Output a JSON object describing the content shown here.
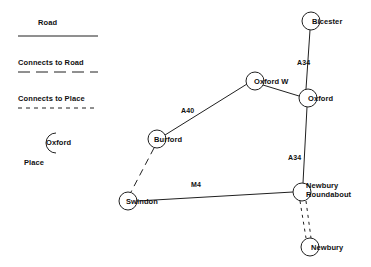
{
  "diagram": {
    "type": "node-link-map",
    "title": "",
    "background_color": "#ffffff",
    "line_color": "#202020",
    "legend": {
      "items": [
        {
          "label": "Road",
          "style": "solid",
          "name": "legend-road"
        },
        {
          "label": "Connects to Road",
          "style": "dashed",
          "name": "legend-connects-to-road"
        },
        {
          "label": "Connects to Place",
          "style": "dotted",
          "name": "legend-connects-to-place"
        }
      ],
      "place_example": {
        "label": "Oxford",
        "caption": "Place"
      }
    },
    "nodes": [
      {
        "id": "bicester",
        "label": "Bicester",
        "cx": 311,
        "cy": 21,
        "r": 9
      },
      {
        "id": "oxford_w",
        "label": "Oxford W",
        "cx": 255,
        "cy": 81,
        "r": 9
      },
      {
        "id": "oxford",
        "label": "Oxford",
        "cx": 308,
        "cy": 98,
        "r": 9
      },
      {
        "id": "burford",
        "label": "Burford",
        "cx": 157,
        "cy": 139,
        "r": 9
      },
      {
        "id": "swindon",
        "label": "Swindon",
        "cx": 128,
        "cy": 201,
        "r": 9
      },
      {
        "id": "newbury_roundabout",
        "label": "Newbury Roundabout",
        "cx": 302,
        "cy": 192,
        "r": 9
      },
      {
        "id": "newbury",
        "label": "Newbury",
        "cx": 310,
        "cy": 247,
        "r": 9
      }
    ],
    "edges": [
      {
        "from": "bicester",
        "to": "oxford",
        "style": "solid",
        "label": "A34"
      },
      {
        "from": "oxford_w",
        "to": "oxford",
        "style": "solid",
        "label": ""
      },
      {
        "from": "burford",
        "to": "oxford_w",
        "style": "solid",
        "label": "A40"
      },
      {
        "from": "oxford",
        "to": "newbury_roundabout",
        "style": "solid",
        "label": "A34"
      },
      {
        "from": "swindon",
        "to": "newbury_roundabout",
        "style": "solid",
        "label": "M4"
      },
      {
        "from": "burford",
        "to": "swindon",
        "style": "dashed",
        "label": ""
      },
      {
        "from": "newbury_roundabout",
        "to": "newbury",
        "style": "dotted",
        "label": ""
      }
    ],
    "edge_labels": [
      {
        "text": "A34",
        "x": 297,
        "y": 59,
        "name": "edge-label-a34-bicester-oxford"
      },
      {
        "text": "A40",
        "x": 181,
        "y": 107,
        "name": "edge-label-a40"
      },
      {
        "text": "A34",
        "x": 288,
        "y": 154,
        "name": "edge-label-a34-oxford-newbury"
      },
      {
        "text": "M4",
        "x": 191,
        "y": 181,
        "name": "edge-label-m4"
      }
    ]
  }
}
